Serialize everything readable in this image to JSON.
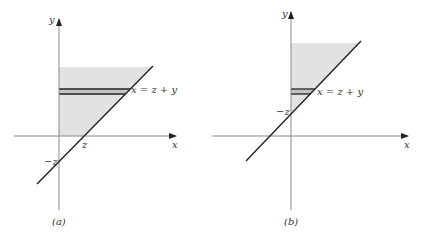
{
  "colors": {
    "axis": "#8a8a8a",
    "line": "#222222",
    "shade": "#e2e2e2",
    "strip": "#bdbdbd",
    "text": "#333333"
  },
  "panels": [
    {
      "caption": "(a)",
      "x_axis_label": "x",
      "y_axis_label": "y",
      "line_label": "x = z + y",
      "x_intercept_label": "z",
      "y_intercept_label": "−z"
    },
    {
      "caption": "(b)",
      "x_axis_label": "x",
      "y_axis_label": "y",
      "line_label": "x = z + y",
      "y_intercept_label": "−z"
    }
  ]
}
